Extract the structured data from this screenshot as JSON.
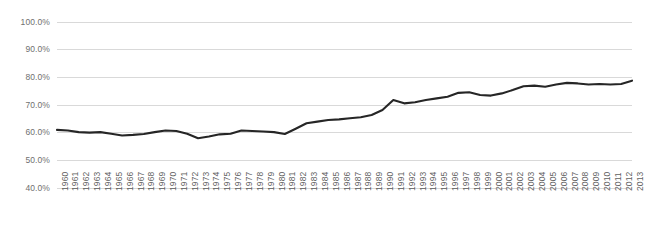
{
  "chart_data": {
    "type": "line",
    "title": "",
    "subtitle": "",
    "xlabel": "",
    "ylabel": "",
    "ylim": [
      40,
      100
    ],
    "ytick_labels": [
      "100.0%",
      "90.0%",
      "80.0%",
      "70.0%",
      "60.0%",
      "50.0%",
      "40.0%"
    ],
    "ytick_values": [
      100,
      90,
      80,
      70,
      60,
      50,
      40
    ],
    "grid": true,
    "grid_axis": "y",
    "legend": false,
    "legend_position": "none",
    "line_color": "#262626",
    "grid_color": "#d9d9d9",
    "background_color": "#ffffff",
    "categories": [
      "1960",
      "1961",
      "1962",
      "1963",
      "1964",
      "1965",
      "1966",
      "1967",
      "1968",
      "1969",
      "1970",
      "1971",
      "1972",
      "1973",
      "1974",
      "1975",
      "1976",
      "1977",
      "1978",
      "1979",
      "1980",
      "1981",
      "1982",
      "1983",
      "1984",
      "1985",
      "1986",
      "1987",
      "1988",
      "1989",
      "1990",
      "1991",
      "1992",
      "1993",
      "1994",
      "1995",
      "1996",
      "1997",
      "1998",
      "1999",
      "2000",
      "2001",
      "2002",
      "2003",
      "2004",
      "2005",
      "2006",
      "2007",
      "2008",
      "2009",
      "2010",
      "2011",
      "2012",
      "2013"
    ],
    "values": [
      61.0,
      60.8,
      60.2,
      60.0,
      60.2,
      59.6,
      59.0,
      59.2,
      59.5,
      60.2,
      60.8,
      60.6,
      59.6,
      58.0,
      58.6,
      59.4,
      59.6,
      60.8,
      60.6,
      60.4,
      60.2,
      59.5,
      61.4,
      63.4,
      64.0,
      64.6,
      64.8,
      65.2,
      65.6,
      66.4,
      68.2,
      71.8,
      70.6,
      71.0,
      71.8,
      72.4,
      73.0,
      74.4,
      74.6,
      73.6,
      73.4,
      74.2,
      75.4,
      76.8,
      77.0,
      76.6,
      77.4,
      78.0,
      77.8,
      77.4,
      77.6,
      77.4,
      77.6,
      78.8
    ]
  }
}
